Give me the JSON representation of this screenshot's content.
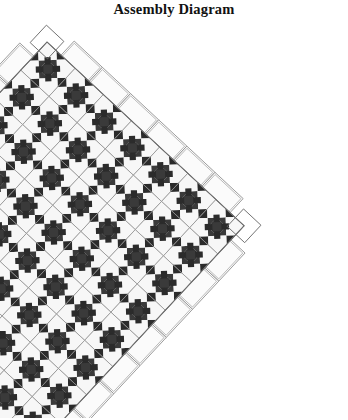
{
  "page": {
    "title": "Assembly Diagram",
    "background_color": "#ffffff"
  },
  "quilt": {
    "name": "on-point-ohio-star-assembly-diagram",
    "setting": "diagonal",
    "block_name": "Ohio Star",
    "block_columns": 7,
    "block_rows": 8,
    "star_block_count": 56,
    "plain_setting_square_count": 42,
    "rotation_degrees": -2.0,
    "block_size_px": 38.5,
    "origin_x_px": 47,
    "origin_y_px": 24,
    "colors": {
      "dark": "#2b2b2b",
      "dark_shade": "#3a3a3a",
      "light": "#f7f7f7",
      "plain_square": "#fbfbfb",
      "outline": "#8c8c8c",
      "border_line": "#6e6e6e",
      "background": "#ffffff"
    },
    "layout_notes": {
      "block_grid_pattern": "3x3 Ohio Star: light corners, quarter-square-triangle edges, dark center",
      "alternating": "star blocks alternate with plain squares on the diagonal set",
      "edges": "side and corner setting triangles finish the diagonal edges"
    }
  },
  "legend": {
    "dark_label": "Dark fabric",
    "light_label": "Light fabric",
    "plain_label": "Plain setting square"
  }
}
